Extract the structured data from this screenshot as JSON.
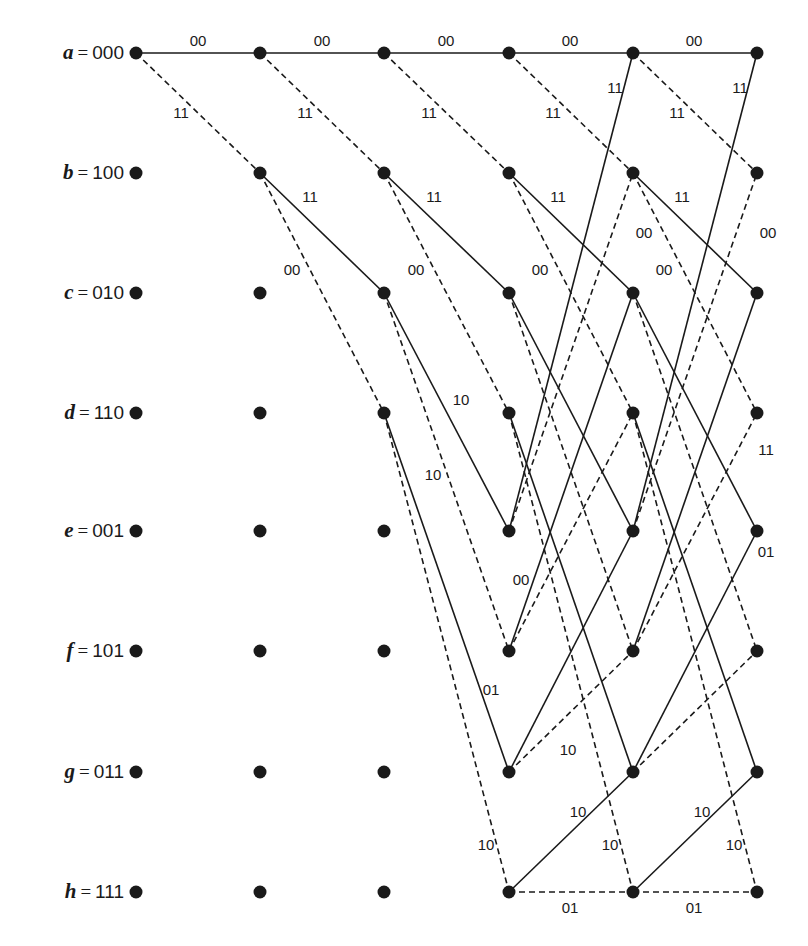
{
  "diagram": {
    "type": "trellis",
    "columns_x": [
      136,
      260,
      384,
      509,
      633,
      757
    ],
    "rows_y": [
      53,
      173,
      293,
      413,
      531,
      651,
      772,
      892
    ],
    "states": [
      {
        "name": "a",
        "bits": "000"
      },
      {
        "name": "b",
        "bits": "100"
      },
      {
        "name": "c",
        "bits": "010"
      },
      {
        "name": "d",
        "bits": "110"
      },
      {
        "name": "e",
        "bits": "001"
      },
      {
        "name": "f",
        "bits": "101"
      },
      {
        "name": "g",
        "bits": "011"
      },
      {
        "name": "h",
        "bits": "111"
      }
    ],
    "legend": {
      "solid": "input 0",
      "dashed": "input 1"
    },
    "transitions": [
      {
        "from": "a",
        "to": "a",
        "style": "solid",
        "output": "00"
      },
      {
        "from": "a",
        "to": "b",
        "style": "dashed",
        "output": "11"
      },
      {
        "from": "b",
        "to": "c",
        "style": "solid",
        "output": "11"
      },
      {
        "from": "b",
        "to": "d",
        "style": "dashed",
        "output": "00"
      },
      {
        "from": "c",
        "to": "e",
        "style": "solid",
        "output": "10"
      },
      {
        "from": "c",
        "to": "f",
        "style": "dashed",
        "output": "01"
      },
      {
        "from": "d",
        "to": "g",
        "style": "solid",
        "output": "01"
      },
      {
        "from": "d",
        "to": "h",
        "style": "dashed",
        "output": "10"
      },
      {
        "from": "e",
        "to": "a",
        "style": "solid",
        "output": "11"
      },
      {
        "from": "e",
        "to": "b",
        "style": "dashed",
        "output": "00"
      },
      {
        "from": "f",
        "to": "c",
        "style": "solid",
        "output": "00"
      },
      {
        "from": "f",
        "to": "d",
        "style": "dashed",
        "output": "11"
      },
      {
        "from": "g",
        "to": "e",
        "style": "solid",
        "output": "01"
      },
      {
        "from": "g",
        "to": "f",
        "style": "dashed",
        "output": "10"
      },
      {
        "from": "h",
        "to": "g",
        "style": "solid",
        "output": "10"
      },
      {
        "from": "h",
        "to": "h",
        "style": "dashed",
        "output": "01"
      }
    ],
    "active_states_per_stage": [
      [
        "a"
      ],
      [
        "a",
        "b"
      ],
      [
        "a",
        "b",
        "c",
        "d"
      ],
      [
        "a",
        "b",
        "c",
        "d",
        "e",
        "f",
        "g",
        "h"
      ],
      [
        "a",
        "b",
        "c",
        "d",
        "e",
        "f",
        "g",
        "h"
      ]
    ],
    "edge_labels": [
      {
        "text": "00",
        "x": 198,
        "y": 46
      },
      {
        "text": "00",
        "x": 322,
        "y": 46
      },
      {
        "text": "00",
        "x": 446,
        "y": 46
      },
      {
        "text": "00",
        "x": 570,
        "y": 46
      },
      {
        "text": "00",
        "x": 694,
        "y": 46
      },
      {
        "text": "11",
        "x": 181,
        "y": 118
      },
      {
        "text": "11",
        "x": 305,
        "y": 118
      },
      {
        "text": "11",
        "x": 429,
        "y": 118
      },
      {
        "text": "11",
        "x": 553,
        "y": 118
      },
      {
        "text": "11",
        "x": 677,
        "y": 118
      },
      {
        "text": "11",
        "x": 615,
        "y": 93
      },
      {
        "text": "11",
        "x": 740,
        "y": 93
      },
      {
        "text": "11",
        "x": 310,
        "y": 202
      },
      {
        "text": "11",
        "x": 434,
        "y": 202
      },
      {
        "text": "11",
        "x": 558,
        "y": 202
      },
      {
        "text": "11",
        "x": 682,
        "y": 202
      },
      {
        "text": "00",
        "x": 644,
        "y": 238
      },
      {
        "text": "00",
        "x": 768,
        "y": 238
      },
      {
        "text": "00",
        "x": 292,
        "y": 275
      },
      {
        "text": "00",
        "x": 416,
        "y": 275
      },
      {
        "text": "00",
        "x": 540,
        "y": 275
      },
      {
        "text": "00",
        "x": 664,
        "y": 275
      },
      {
        "text": "10",
        "x": 461,
        "y": 405
      },
      {
        "text": "10",
        "x": 433,
        "y": 480
      },
      {
        "text": "11",
        "x": 766,
        "y": 455
      },
      {
        "text": "00",
        "x": 521,
        "y": 585
      },
      {
        "text": "01",
        "x": 766,
        "y": 557
      },
      {
        "text": "01",
        "x": 491,
        "y": 695
      },
      {
        "text": "10",
        "x": 568,
        "y": 755
      },
      {
        "text": "10",
        "x": 578,
        "y": 817
      },
      {
        "text": "10",
        "x": 702,
        "y": 817
      },
      {
        "text": "10",
        "x": 486,
        "y": 850
      },
      {
        "text": "10",
        "x": 610,
        "y": 850
      },
      {
        "text": "10",
        "x": 734,
        "y": 850
      },
      {
        "text": "01",
        "x": 570,
        "y": 913
      },
      {
        "text": "01",
        "x": 694,
        "y": 913
      }
    ]
  },
  "state_labels": [
    {
      "var": "a",
      "eq": "=",
      "bits": "000"
    },
    {
      "var": "b",
      "eq": "=",
      "bits": "100"
    },
    {
      "var": "c",
      "eq": "=",
      "bits": "010"
    },
    {
      "var": "d",
      "eq": "=",
      "bits": "110"
    },
    {
      "var": "e",
      "eq": "=",
      "bits": "001"
    },
    {
      "var": "f",
      "eq": "=",
      "bits": "101"
    },
    {
      "var": "g",
      "eq": "=",
      "bits": "011"
    },
    {
      "var": "h",
      "eq": "=",
      "bits": "111"
    }
  ],
  "colors": {
    "ink": "#1a1a1a",
    "background": "#ffffff"
  }
}
